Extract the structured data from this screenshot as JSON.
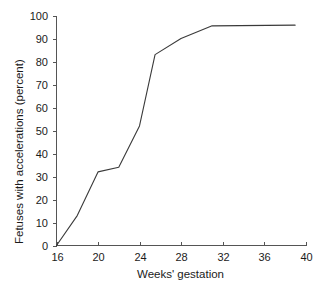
{
  "chart_data": {
    "type": "line",
    "title": "",
    "subtitle": "",
    "xlabel": "Weeks' gestation",
    "ylabel": "Fetuses with accelerations (percent)",
    "xlim": [
      16,
      40
    ],
    "ylim": [
      0,
      100
    ],
    "xticks": [
      16,
      20,
      24,
      28,
      32,
      36,
      40
    ],
    "xtick_labels": [
      "16",
      "20",
      "24",
      "28",
      "32",
      "36",
      "40"
    ],
    "yticks": [
      0,
      10,
      20,
      30,
      40,
      50,
      60,
      70,
      80,
      90,
      100
    ],
    "ytick_labels": [
      "0",
      "10",
      "20",
      "30",
      "40",
      "50",
      "60",
      "70",
      "80",
      "90",
      "100"
    ],
    "grid": false,
    "legend": false,
    "legend_position": "none",
    "line_color": "#3a3a3a",
    "line_width": 1.1,
    "axis_color": "#555555",
    "background_color": "#ffffff",
    "series": [
      {
        "name": "Fetuses with accelerations",
        "x": [
          16,
          18,
          20,
          22,
          24,
          25.5,
          28,
          31,
          39
        ],
        "values": [
          0,
          13,
          32,
          34,
          52,
          83,
          90,
          95.5,
          95.8
        ]
      }
    ],
    "annotations": []
  },
  "axis_titles": {
    "x": "Weeks' gestation",
    "y": "Fetuses with accelerations (percent)"
  }
}
